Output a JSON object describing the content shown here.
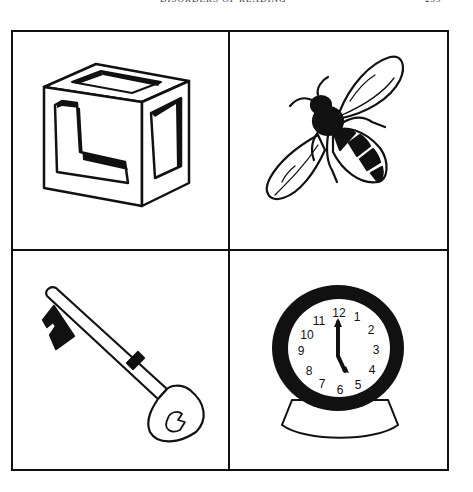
{
  "page": {
    "running_header": "DISORDERS OF READING",
    "page_number": "259"
  },
  "figure": {
    "layout": "2x2 grid",
    "panels": [
      {
        "position": "top-left",
        "subject": "block",
        "letters": [
          "L",
          "I",
          "O"
        ]
      },
      {
        "position": "top-right",
        "subject": "bee"
      },
      {
        "position": "bottom-left",
        "subject": "key",
        "bow_mark": "3"
      },
      {
        "position": "bottom-right",
        "subject": "clock",
        "numerals": [
          "12",
          "1",
          "2",
          "3",
          "4",
          "5",
          "6",
          "7",
          "8",
          "9",
          "10",
          "11"
        ],
        "time_shown": "5:00"
      }
    ],
    "line_color": "#111111",
    "background": "#ffffff"
  }
}
